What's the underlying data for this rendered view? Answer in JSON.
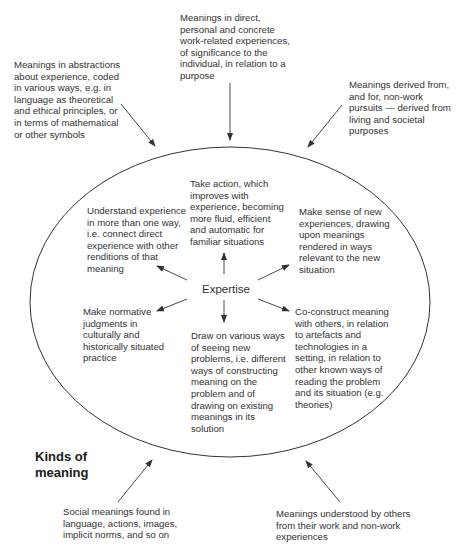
{
  "diagram": {
    "center_label": "Expertise",
    "kinds_label": "Kinds of\nmeaning",
    "outer_meanings": [
      {
        "id": "abstractions",
        "text": "Meanings in abstractions\nabout experience, coded\nin various ways, e.g. in\nlanguage as theoretical\nand ethical principles, or\nin terms of mathematical\nor other symbols"
      },
      {
        "id": "direct",
        "text": "Meanings in direct,\npersonal and concrete\nwork-related experiences,\nof significance to the\nindividual, in relation to a\npurpose"
      },
      {
        "id": "non-work",
        "text": "Meanings derived from,\nand for, non-work\npursuits — derived from\nliving and societal\npurposes"
      },
      {
        "id": "social",
        "text": "Social meanings found in\nlanguage, actions, images,\nimplicit norms, and so on"
      },
      {
        "id": "others",
        "text": "Meanings understood by others\nfrom their work and non-work\nexperiences"
      }
    ],
    "inner_capabilities": [
      {
        "id": "understand",
        "text": "Understand experience\nin more than one way,\ni.e. connect direct\nexperience with other\nrenditions of that\nmeaning"
      },
      {
        "id": "take-action",
        "text": "Take action, which\nimproves with\nexperience, becoming\nmore fluid, efficient\nand automatic for\nfamiliar situations"
      },
      {
        "id": "make-sense",
        "text": "Make sense of new\nexperiences, drawing\nupon meanings\nrendered in ways\nrelevant to the new\nsituation"
      },
      {
        "id": "normative",
        "text": "Make normative\njudgments in\nculturally and\nhistorically situated\npractice"
      },
      {
        "id": "draw-on",
        "text": "Draw on various ways\nof seeing new\nproblems, i.e. different\nways of constructing\nmeaning on the\nproblem and of\ndrawing on existing\nmeanings in its\nsolution"
      },
      {
        "id": "co-construct",
        "text": "Co-construct meaning\nwith others, in relation\nto artefacts and\ntechnologies in a\nsetting, in relation to\nother known ways of\nreading the problem\nand its situation (e.g.\ntheories)"
      }
    ],
    "colors": {
      "line": "#333333",
      "text": "#333333",
      "background": "#ffffff"
    }
  }
}
